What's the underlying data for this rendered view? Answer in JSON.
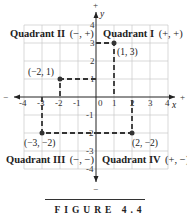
{
  "figure": {
    "caption": "FIGURE 4.4",
    "x_axis_label": "x",
    "y_axis_label": "y",
    "x_ticks": [
      "-4",
      "-3",
      "-2",
      "-1",
      "0",
      "1",
      "2",
      "3",
      "4"
    ],
    "y_ticks": [
      "4",
      "3",
      "2",
      "1",
      "-1",
      "-2",
      "-3",
      "-4"
    ],
    "axis_end_signs": {
      "left": "−",
      "right": "+",
      "top": "+",
      "bottom": "−"
    },
    "quadrants": [
      {
        "name": "Quadrant I",
        "signs": "(+, +)"
      },
      {
        "name": "Quadrant II",
        "signs": "(−, +)"
      },
      {
        "name": "Quadrant III",
        "signs": "(−, −)"
      },
      {
        "name": "Quadrant IV",
        "signs": "(+, −)"
      }
    ],
    "points": [
      {
        "label": "(1, 3)",
        "x": 1,
        "y": 3
      },
      {
        "label": "(−2, 1)",
        "x": -2,
        "y": 1
      },
      {
        "label": "(−3, −2)",
        "x": -3,
        "y": -2
      },
      {
        "label": "(2, −2)",
        "x": 2,
        "y": -2
      }
    ],
    "colors": {
      "axis": "#222222",
      "grid": "#c8c8c8",
      "dash": "#333333"
    }
  }
}
